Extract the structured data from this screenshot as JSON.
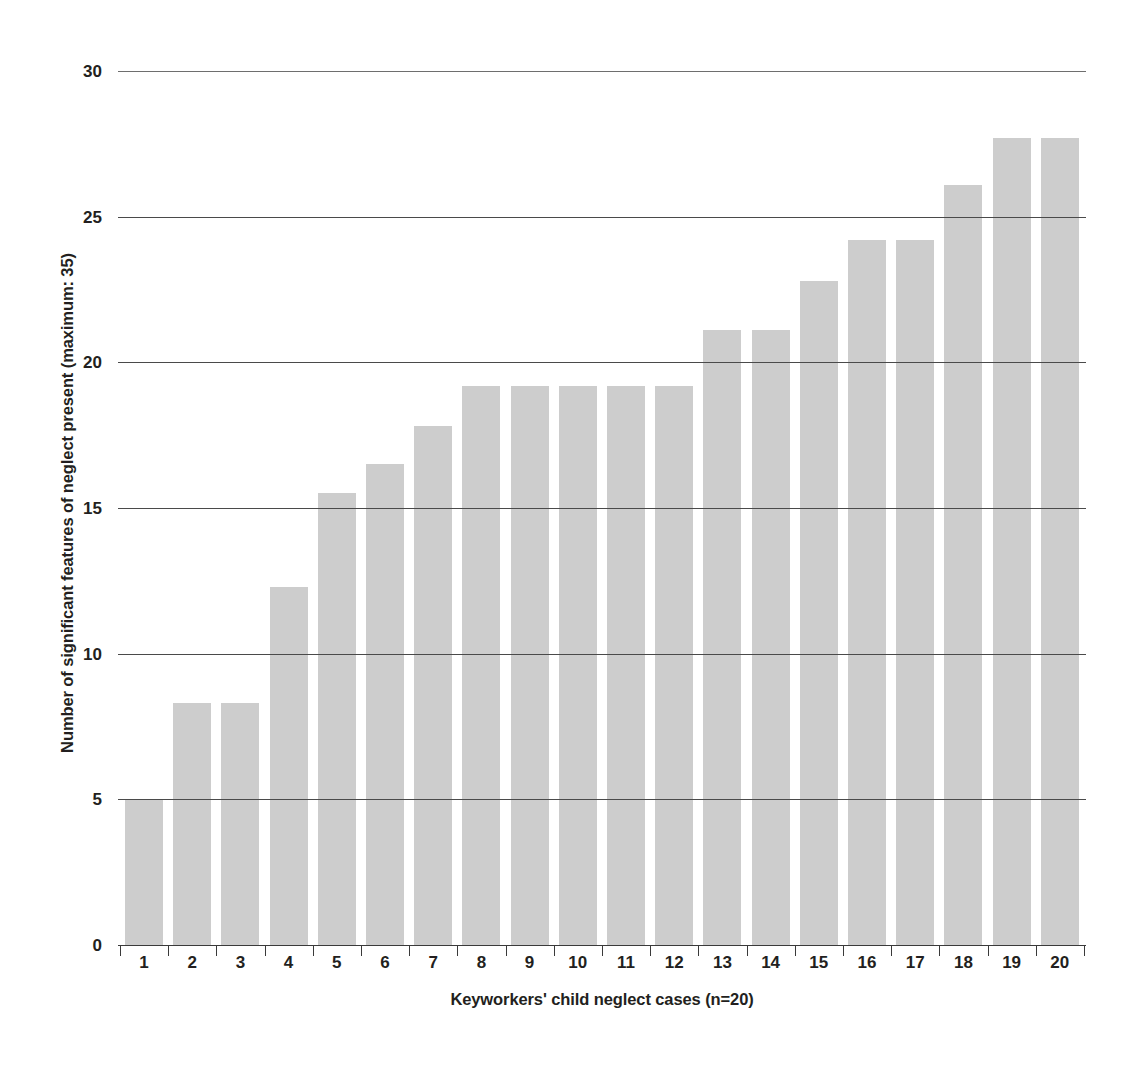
{
  "chart_data": {
    "type": "bar",
    "title": "",
    "xlabel": "Keyworkers' child neglect cases (n=20)",
    "ylabel": "Number of significant features of neglect present (maximum: 35)",
    "categories": [
      "1",
      "2",
      "3",
      "4",
      "5",
      "6",
      "7",
      "8",
      "9",
      "10",
      "11",
      "12",
      "13",
      "14",
      "15",
      "16",
      "17",
      "18",
      "19",
      "20"
    ],
    "values": [
      5.0,
      8.3,
      8.3,
      12.3,
      15.5,
      16.5,
      17.8,
      19.2,
      19.2,
      19.2,
      19.2,
      19.2,
      21.1,
      21.1,
      22.8,
      24.2,
      24.2,
      26.1,
      27.7,
      27.7
    ],
    "ylim": [
      0,
      30
    ],
    "y_ticks": [
      0,
      5,
      10,
      15,
      20,
      25,
      30
    ],
    "y_tick_labels": [
      "0",
      "5",
      "10",
      "15",
      "20",
      "25",
      "30"
    ],
    "grid": true,
    "legend": false,
    "bar_color": "#cdcdcd",
    "gridline_color": "#4a4a4a",
    "axis_color": "#3a3a3a",
    "text_color": "#231f20",
    "background": "#ffffff"
  }
}
